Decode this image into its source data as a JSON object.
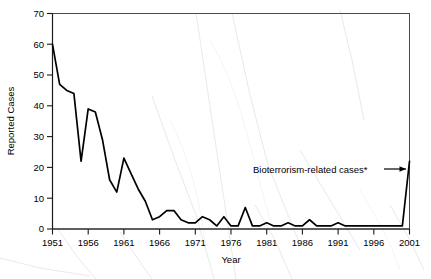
{
  "chart_data": {
    "type": "line",
    "title": "",
    "xlabel": "Year",
    "ylabel": "Reported Cases",
    "xlim": [
      1951,
      2001
    ],
    "ylim": [
      0,
      70
    ],
    "grid": false,
    "legend": null,
    "xticks": [
      "1951",
      "1956",
      "1961",
      "1966",
      "1971",
      "1976",
      "1981",
      "1986",
      "1991",
      "1996",
      "2001"
    ],
    "xtick_values": [
      1951,
      1956,
      1961,
      1966,
      1971,
      1976,
      1981,
      1986,
      1991,
      1996,
      2001
    ],
    "yticks": [
      "0",
      "10",
      "20",
      "30",
      "40",
      "50",
      "60",
      "70"
    ],
    "ytick_values": [
      0,
      10,
      20,
      30,
      40,
      50,
      60,
      70
    ],
    "x": [
      1951,
      1952,
      1953,
      1954,
      1955,
      1956,
      1957,
      1958,
      1959,
      1960,
      1961,
      1962,
      1963,
      1964,
      1965,
      1966,
      1967,
      1968,
      1969,
      1970,
      1971,
      1972,
      1973,
      1974,
      1975,
      1976,
      1977,
      1978,
      1979,
      1980,
      1981,
      1982,
      1983,
      1984,
      1985,
      1986,
      1987,
      1988,
      1989,
      1990,
      1991,
      1992,
      1993,
      1994,
      1995,
      1996,
      1997,
      1998,
      1999,
      2000,
      2001
    ],
    "values": [
      60,
      47,
      45,
      44,
      22,
      39,
      38,
      29,
      16,
      12,
      23,
      18,
      13,
      9,
      3,
      4,
      6,
      6,
      3,
      2,
      2,
      4,
      3,
      1,
      4,
      1,
      1,
      7,
      1,
      1,
      2,
      1,
      1,
      2,
      1,
      1,
      3,
      1,
      1,
      1,
      2,
      1,
      1,
      1,
      1,
      1,
      1,
      1,
      1,
      1,
      22
    ],
    "series_color": "#000000",
    "annotations": [
      {
        "text": "Bioterrorism-related cases*",
        "points_to_year": 2001,
        "points_to_value": 22
      }
    ]
  },
  "axes": {
    "y_axis_title": "Reported Cases",
    "x_axis_title": "Year"
  }
}
